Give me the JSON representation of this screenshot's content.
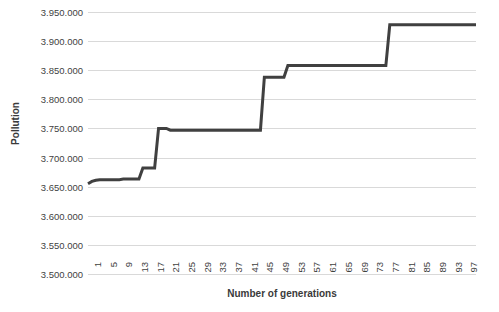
{
  "chart_data": {
    "type": "line",
    "title": "",
    "xlabel": "Number of generations",
    "ylabel": "Pollution",
    "ylim": [
      3500000,
      3950000
    ],
    "ytick_labels": [
      "3.950.000",
      "3.900.000",
      "3.850.000",
      "3.800.000",
      "3.750.000",
      "3.700.000",
      "3.650.000",
      "3.600.000",
      "3.550.000",
      "3.500.000"
    ],
    "ytick_values": [
      3950000,
      3900000,
      3850000,
      3800000,
      3750000,
      3700000,
      3650000,
      3600000,
      3550000,
      3500000
    ],
    "xlim": [
      1,
      100
    ],
    "xtick_labels": [
      "1",
      "5",
      "9",
      "13",
      "17",
      "21",
      "25",
      "29",
      "33",
      "37",
      "41",
      "45",
      "49",
      "53",
      "57",
      "61",
      "65",
      "69",
      "73",
      "77",
      "81",
      "85",
      "89",
      "93",
      "97"
    ],
    "grid": "horizontal",
    "legend": "none",
    "series": [
      {
        "name": "Pollution",
        "color": "#404040",
        "x": [
          1,
          2,
          3,
          4,
          5,
          6,
          7,
          8,
          9,
          10,
          11,
          12,
          13,
          14,
          15,
          16,
          17,
          18,
          19,
          20,
          21,
          22,
          23,
          24,
          25,
          26,
          27,
          28,
          29,
          30,
          31,
          32,
          33,
          34,
          35,
          36,
          37,
          38,
          39,
          40,
          41,
          42,
          43,
          44,
          45,
          46,
          47,
          48,
          49,
          50,
          51,
          52,
          53,
          54,
          55,
          56,
          57,
          58,
          59,
          60,
          61,
          62,
          63,
          64,
          65,
          66,
          67,
          68,
          69,
          70,
          71,
          72,
          73,
          74,
          75,
          76,
          77,
          78,
          79,
          80,
          81,
          82,
          83,
          84,
          85,
          86,
          87,
          88,
          89,
          90,
          91,
          92,
          93,
          94,
          95,
          96,
          97,
          98,
          99,
          100
        ],
        "values": [
          3655000,
          3659000,
          3661000,
          3662000,
          3662000,
          3662000,
          3662000,
          3662000,
          3662000,
          3663000,
          3663000,
          3663000,
          3663000,
          3663000,
          3682000,
          3682000,
          3682000,
          3682000,
          3750000,
          3750000,
          3750000,
          3747000,
          3747000,
          3747000,
          3747000,
          3747000,
          3747000,
          3747000,
          3747000,
          3747000,
          3747000,
          3747000,
          3747000,
          3747000,
          3747000,
          3747000,
          3747000,
          3747000,
          3747000,
          3747000,
          3747000,
          3747000,
          3747000,
          3747000,
          3747000,
          3838000,
          3838000,
          3838000,
          3838000,
          3838000,
          3838000,
          3858000,
          3858000,
          3858000,
          3858000,
          3858000,
          3858000,
          3858000,
          3858000,
          3858000,
          3858000,
          3858000,
          3858000,
          3858000,
          3858000,
          3858000,
          3858000,
          3858000,
          3858000,
          3858000,
          3858000,
          3858000,
          3858000,
          3858000,
          3858000,
          3858000,
          3858000,
          3928000,
          3928000,
          3928000,
          3928000,
          3928000,
          3928000,
          3928000,
          3928000,
          3928000,
          3928000,
          3928000,
          3928000,
          3928000,
          3928000,
          3928000,
          3928000,
          3928000,
          3928000,
          3928000,
          3928000,
          3928000,
          3928000,
          3928000
        ]
      }
    ]
  },
  "colors": {
    "series": "#404040",
    "gridline": "#d9d9d9",
    "text": "#3f3f3f",
    "background": "#ffffff"
  }
}
